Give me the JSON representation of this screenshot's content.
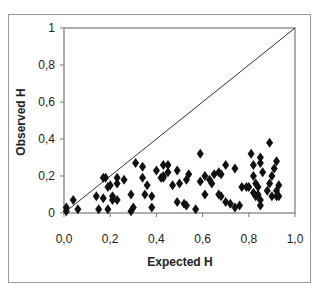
{
  "chart_data": {
    "type": "scatter",
    "title": "",
    "xlabel": "Expected H",
    "ylabel": "Observed H",
    "xlim": [
      0,
      1
    ],
    "ylim": [
      0,
      1
    ],
    "x_ticks": [
      "0,0",
      "0,2",
      "0,4",
      "0,6",
      "0,8",
      "1,0"
    ],
    "y_ticks": [
      "0",
      "0,2",
      "0,4",
      "0,6",
      "0,8",
      "1"
    ],
    "grid": false,
    "legend": null,
    "marker": "diamond",
    "reference_line": {
      "label": "y = x",
      "from": [
        0,
        0
      ],
      "to": [
        1,
        1
      ]
    },
    "series": [
      {
        "name": "Loci",
        "points": [
          [
            0.01,
            0.01
          ],
          [
            0.01,
            0.03
          ],
          [
            0.04,
            0.07
          ],
          [
            0.06,
            0.02
          ],
          [
            0.14,
            0.09
          ],
          [
            0.15,
            0.02
          ],
          [
            0.17,
            0.19
          ],
          [
            0.18,
            0.19
          ],
          [
            0.17,
            0.08
          ],
          [
            0.19,
            0.14
          ],
          [
            0.19,
            0.02
          ],
          [
            0.21,
            0.07
          ],
          [
            0.23,
            0.19
          ],
          [
            0.2,
            0.15
          ],
          [
            0.21,
            0.09
          ],
          [
            0.23,
            0.16
          ],
          [
            0.23,
            0.07
          ],
          [
            0.26,
            0.18
          ],
          [
            0.29,
            0.1
          ],
          [
            0.3,
            0.03
          ],
          [
            0.29,
            0.01
          ],
          [
            0.31,
            0.27
          ],
          [
            0.34,
            0.25
          ],
          [
            0.34,
            0.19
          ],
          [
            0.35,
            0.1
          ],
          [
            0.36,
            0.15
          ],
          [
            0.38,
            0.09
          ],
          [
            0.38,
            0.03
          ],
          [
            0.4,
            0.23
          ],
          [
            0.42,
            0.19
          ],
          [
            0.43,
            0.19
          ],
          [
            0.45,
            0.26
          ],
          [
            0.45,
            0.22
          ],
          [
            0.43,
            0.26
          ],
          [
            0.43,
            0.2
          ],
          [
            0.47,
            0.15
          ],
          [
            0.49,
            0.23
          ],
          [
            0.5,
            0.16
          ],
          [
            0.49,
            0.06
          ],
          [
            0.52,
            0.05
          ],
          [
            0.54,
            0.21
          ],
          [
            0.53,
            0.18
          ],
          [
            0.53,
            0.04
          ],
          [
            0.57,
            0.02
          ],
          [
            0.59,
            0.32
          ],
          [
            0.59,
            0.17
          ],
          [
            0.61,
            0.2
          ],
          [
            0.61,
            0.1
          ],
          [
            0.63,
            0.18
          ],
          [
            0.65,
            0.21
          ],
          [
            0.67,
            0.22
          ],
          [
            0.67,
            0.1
          ],
          [
            0.64,
            0.16
          ],
          [
            0.68,
            0.21
          ],
          [
            0.7,
            0.26
          ],
          [
            0.68,
            0.09
          ],
          [
            0.7,
            0.06
          ],
          [
            0.72,
            0.05
          ],
          [
            0.74,
            0.24
          ],
          [
            0.77,
            0.14
          ],
          [
            0.79,
            0.14
          ],
          [
            0.74,
            0.03
          ],
          [
            0.76,
            0.04
          ],
          [
            0.81,
            0.32
          ],
          [
            0.82,
            0.26
          ],
          [
            0.82,
            0.2
          ],
          [
            0.83,
            0.16
          ],
          [
            0.83,
            0.09
          ],
          [
            0.84,
            0.14
          ],
          [
            0.85,
            0.27
          ],
          [
            0.8,
            0.14
          ],
          [
            0.82,
            0.11
          ],
          [
            0.84,
            0.1
          ],
          [
            0.85,
            0.07
          ],
          [
            0.85,
            0.04
          ],
          [
            0.89,
            0.38
          ],
          [
            0.85,
            0.3
          ],
          [
            0.86,
            0.22
          ],
          [
            0.88,
            0.12
          ],
          [
            0.9,
            0.09
          ],
          [
            0.92,
            0.28
          ],
          [
            0.91,
            0.24
          ],
          [
            0.9,
            0.2
          ],
          [
            0.89,
            0.16
          ],
          [
            0.93,
            0.15
          ],
          [
            0.92,
            0.12
          ],
          [
            0.92,
            0.09
          ],
          [
            0.93,
            0.09
          ]
        ]
      }
    ]
  }
}
